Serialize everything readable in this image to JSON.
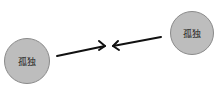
{
  "nodes": [
    {
      "id": "left",
      "label": "孤独",
      "cx": 27,
      "cy": 61,
      "r": 23
    },
    {
      "id": "right",
      "label": "孤独",
      "cx": 192,
      "cy": 33,
      "r": 22
    }
  ],
  "arrows": [
    {
      "from": [
        57,
        56
      ],
      "to": [
        105,
        46
      ]
    },
    {
      "from": [
        161,
        37
      ],
      "to": [
        113,
        46
      ]
    }
  ],
  "colors": {
    "node_fill": "#bdbdbd",
    "node_stroke": "#8a8a8a",
    "arrow": "#111111"
  }
}
